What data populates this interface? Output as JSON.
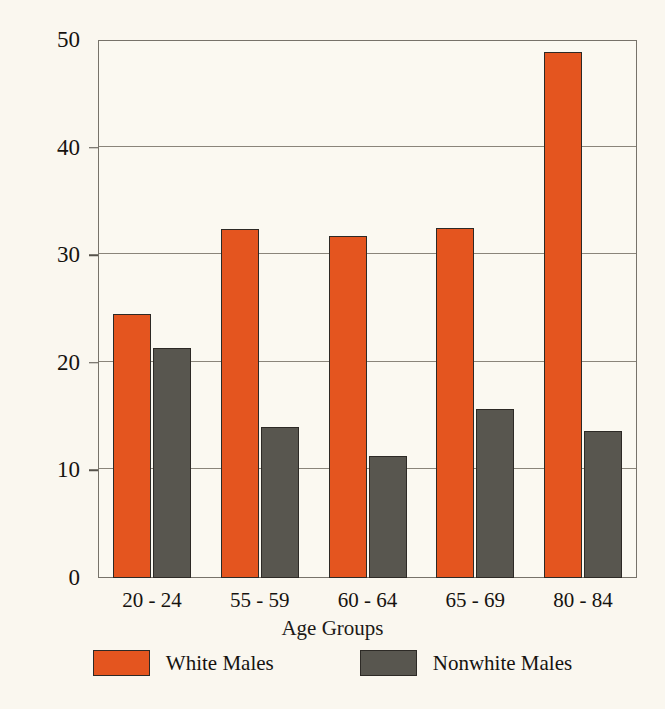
{
  "chart_data": {
    "type": "bar",
    "title": "",
    "xlabel": "Age Groups",
    "ylabel": "Suicide Rate/100,000 Population",
    "categories": [
      "20 - 24",
      "55 - 59",
      "60 - 64",
      "65 - 69",
      "80 - 84"
    ],
    "series": [
      {
        "name": "White Males",
        "color": "#e4551f",
        "values": [
          24.5,
          32.4,
          31.8,
          32.5,
          48.9
        ]
      },
      {
        "name": "Nonwhite Males",
        "color": "#58564f",
        "values": [
          21.4,
          14.0,
          11.3,
          15.7,
          13.7
        ]
      }
    ],
    "ylim": [
      0,
      50
    ],
    "yticks": [
      0,
      10,
      20,
      30,
      40,
      50
    ],
    "ytick_labels": [
      "0",
      "10",
      "20",
      "30",
      "40",
      "50"
    ],
    "grid": true,
    "legend_position": "bottom",
    "background_color": "#faf7ef",
    "axis_color": "#77736a"
  }
}
